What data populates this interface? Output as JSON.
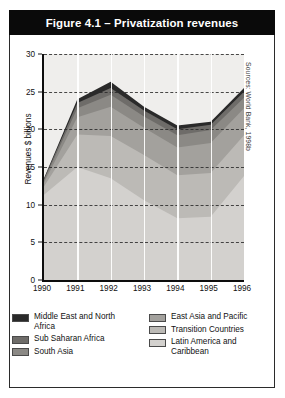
{
  "figure": {
    "title": "Figure 4.1 – Privatization revenues",
    "source_note": "Sources: World Bank, 1998b"
  },
  "chart_data": {
    "type": "area",
    "stacked": true,
    "title": "Figure 4.1 – Privatization revenues",
    "xlabel": "",
    "ylabel": "Revenues $ billions",
    "x": [
      "1990",
      "1991",
      "1992",
      "1993",
      "1994",
      "1995",
      "1996"
    ],
    "categories": [
      "1990",
      "1991",
      "1992",
      "1993",
      "1994",
      "1995",
      "1996"
    ],
    "ylim": [
      0,
      30
    ],
    "yticks": [
      0,
      5,
      10,
      15,
      20,
      25,
      30
    ],
    "grid": "horizontal-dashed",
    "legend_position": "bottom",
    "series": [
      {
        "name": "Latin America and Caribbean",
        "color": "#d3d1ce",
        "values": [
          11.3,
          15.0,
          13.5,
          10.6,
          8.2,
          8.4,
          13.8
        ]
      },
      {
        "name": "Transition Countries",
        "color": "#bcbab6",
        "values": [
          1.1,
          4.3,
          5.6,
          6.0,
          5.7,
          5.8,
          5.4
        ]
      },
      {
        "name": "East Asia and Pacific",
        "color": "#a3a19d",
        "values": [
          0.5,
          2.3,
          3.9,
          3.6,
          3.7,
          4.0,
          3.6
        ]
      },
      {
        "name": "South Asia",
        "color": "#8b8985",
        "values": [
          0.3,
          1.2,
          1.6,
          1.5,
          1.6,
          1.7,
          1.4
        ]
      },
      {
        "name": "Sub Saharan Africa",
        "color": "#6e6c69",
        "values": [
          0.2,
          0.7,
          0.9,
          0.8,
          0.8,
          0.7,
          0.8
        ]
      },
      {
        "name": "Middle East and North Africa",
        "color": "#2a2a2a",
        "values": [
          0.1,
          0.5,
          0.8,
          0.5,
          0.5,
          0.4,
          0.5
        ]
      }
    ],
    "totals": [
      13.5,
      24.0,
      26.3,
      23.0,
      20.5,
      21.0,
      25.5
    ]
  },
  "legend": {
    "left": [
      {
        "label": "Middle East and North Africa",
        "color": "#2a2a2a"
      },
      {
        "label": "Sub Saharan Africa",
        "color": "#6e6c69"
      },
      {
        "label": "South Asia",
        "color": "#8b8985"
      }
    ],
    "right": [
      {
        "label": "East Asia and Pacific",
        "color": "#a3a19d"
      },
      {
        "label": "Transition Countries",
        "color": "#bcbab6"
      },
      {
        "label": "Latin America and Caribbean",
        "color": "#d3d1ce"
      }
    ]
  }
}
